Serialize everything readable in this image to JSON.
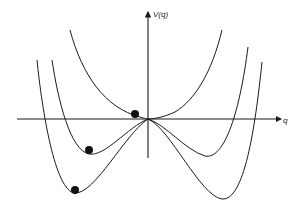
{
  "diagram": {
    "axes": {
      "y_label": "V(q)",
      "x_label": "q"
    },
    "curves": [
      {
        "name": "single-well-potential",
        "description": "Quartic potential with single minimum at origin"
      },
      {
        "name": "double-well-potential-shallow",
        "description": "Double-well potential, moderate depth"
      },
      {
        "name": "double-well-potential-deep",
        "description": "Double-well potential, deep minima"
      }
    ],
    "balls": [
      {
        "name": "ball-at-origin",
        "curve": "single-well-potential"
      },
      {
        "name": "ball-in-shallow-well",
        "curve": "double-well-potential-shallow"
      },
      {
        "name": "ball-in-deep-well",
        "curve": "double-well-potential-deep"
      }
    ],
    "colors": {
      "line": "#1a1a1a",
      "background": "#ffffff"
    }
  }
}
